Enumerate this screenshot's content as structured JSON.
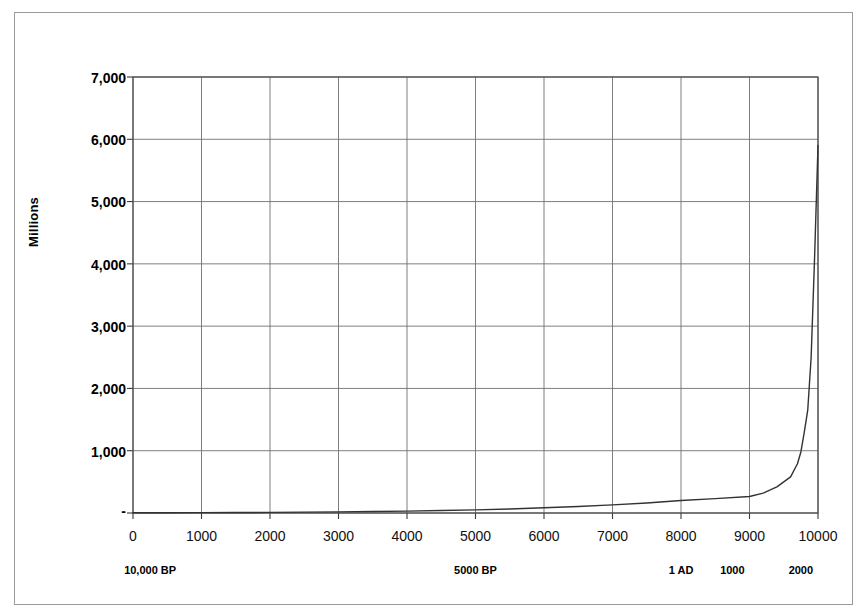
{
  "chart_data": {
    "type": "line",
    "title": "",
    "xlabel": "",
    "ylabel": "Millions",
    "xlim": [
      0,
      10000
    ],
    "ylim": [
      0,
      7000
    ],
    "grid": true,
    "legend": "none",
    "y_ticks": [
      "-",
      "1,000",
      "2,000",
      "3,000",
      "4,000",
      "5,000",
      "6,000",
      "7,000"
    ],
    "y_tick_values": [
      0,
      1000,
      2000,
      3000,
      4000,
      5000,
      6000,
      7000
    ],
    "x_ticks": [
      "0",
      "1000",
      "2000",
      "3000",
      "4000",
      "5000",
      "6000",
      "7000",
      "8000",
      "9000",
      "10000"
    ],
    "x_tick_values": [
      0,
      1000,
      2000,
      3000,
      4000,
      5000,
      6000,
      7000,
      8000,
      9000,
      10000
    ],
    "x_secondary_labels": [
      {
        "label": "10,000 BP",
        "x": 250
      },
      {
        "label": "5000 BP",
        "x": 5000
      },
      {
        "label": "1 AD",
        "x": 8000
      },
      {
        "label": "1000",
        "x": 8750
      },
      {
        "label": "2000",
        "x": 9750
      }
    ],
    "series": [
      {
        "name": "World population",
        "color": "#333333",
        "x": [
          0,
          500,
          1000,
          1500,
          2000,
          2500,
          3000,
          3500,
          4000,
          4500,
          5000,
          5500,
          6000,
          6500,
          7000,
          7500,
          8000,
          8500,
          9000,
          9200,
          9400,
          9500,
          9600,
          9700,
          9750,
          9800,
          9850,
          9900,
          9950,
          10000
        ],
        "y": [
          4,
          5,
          6,
          8,
          10,
          14,
          18,
          24,
          30,
          40,
          50,
          65,
          85,
          105,
          130,
          160,
          200,
          230,
          265,
          320,
          420,
          500,
          580,
          790,
          980,
          1300,
          1650,
          2500,
          4100,
          5900
        ]
      }
    ]
  }
}
